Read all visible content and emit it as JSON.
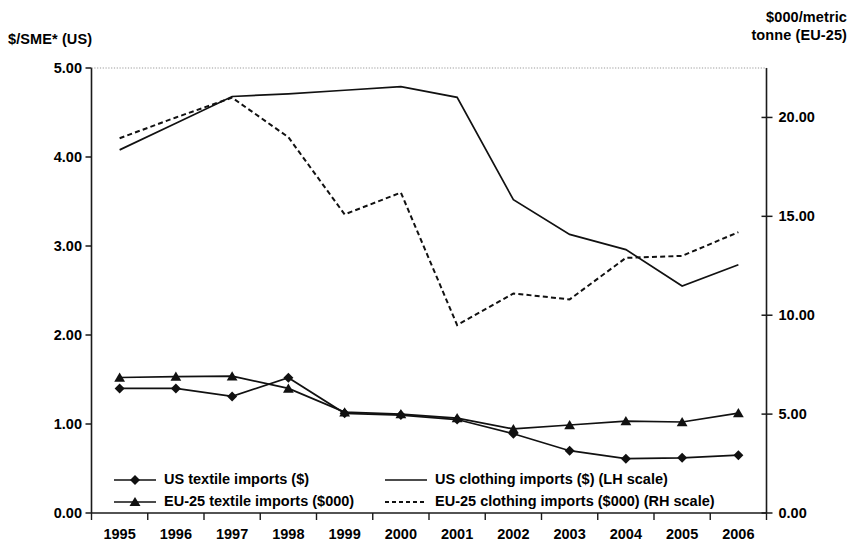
{
  "chart_data": {
    "type": "line",
    "title": "",
    "subtitle": "",
    "xlabel": "",
    "ylabel": "$/SME* (US)",
    "y2label": "$000/metric tonne (EU-25)",
    "grid": false,
    "legend_position": "bottom-inside",
    "categories": [
      "1995",
      "1996",
      "1997",
      "1998",
      "1999",
      "2000",
      "2001",
      "2002",
      "2003",
      "2004",
      "2005",
      "2006"
    ],
    "x": [
      1995,
      1996,
      1997,
      1998,
      1999,
      2000,
      2001,
      2002,
      2003,
      2004,
      2005,
      2006
    ],
    "ylim": [
      0.0,
      5.0
    ],
    "yticks": [
      "0.00",
      "1.00",
      "2.00",
      "3.00",
      "4.00",
      "5.00"
    ],
    "ytick_values": [
      0.0,
      1.0,
      2.0,
      3.0,
      4.0,
      5.0
    ],
    "y2lim": [
      0.0,
      22.5
    ],
    "y2ticks": [
      "0.00",
      "5.00",
      "10.00",
      "15.00",
      "20.00"
    ],
    "y2tick_values": [
      0.0,
      5.0,
      10.0,
      15.0,
      20.0
    ],
    "series": [
      {
        "name": "US textile imports ($)",
        "axis": "left",
        "style": "solid",
        "marker": "diamond",
        "values": [
          1.4,
          1.4,
          1.31,
          1.52,
          1.12,
          1.1,
          1.05,
          0.89,
          0.7,
          0.61,
          0.62,
          0.65
        ]
      },
      {
        "name": "EU-25 textile imports ($000)",
        "axis": "right",
        "style": "solid",
        "marker": "triangle",
        "values": [
          6.85,
          6.9,
          6.92,
          6.3,
          5.1,
          5.0,
          4.8,
          4.25,
          4.45,
          4.65,
          4.6,
          5.05
        ]
      },
      {
        "name": "US clothing imports ($) (LH scale)",
        "axis": "left",
        "style": "solid",
        "marker": "none",
        "values": [
          4.08,
          4.38,
          4.68,
          4.71,
          4.75,
          4.79,
          4.67,
          3.52,
          3.13,
          2.96,
          2.55,
          2.79
        ]
      },
      {
        "name": "EU-25 clothing imports ($000) (RH scale)",
        "axis": "right",
        "style": "dotted",
        "marker": "none",
        "values": [
          18.95,
          20.0,
          21.0,
          19.0,
          15.1,
          16.2,
          9.5,
          11.1,
          10.8,
          12.9,
          13.0,
          14.2
        ]
      }
    ],
    "legend": [
      {
        "label": "US textile imports ($)",
        "marker": "diamond",
        "style": "solid"
      },
      {
        "label": "EU-25 textile imports ($000)",
        "marker": "triangle",
        "style": "solid"
      },
      {
        "label": "US clothing imports ($) (LH scale)",
        "marker": "none",
        "style": "solid"
      },
      {
        "label": "EU-25 clothing imports ($000) (RH scale)",
        "marker": "none",
        "style": "dotted"
      }
    ]
  },
  "axes": {
    "left_title": "$/SME* (US)",
    "right_title_line1": "$000/metric",
    "right_title_line2": "tonne (EU-25)"
  }
}
